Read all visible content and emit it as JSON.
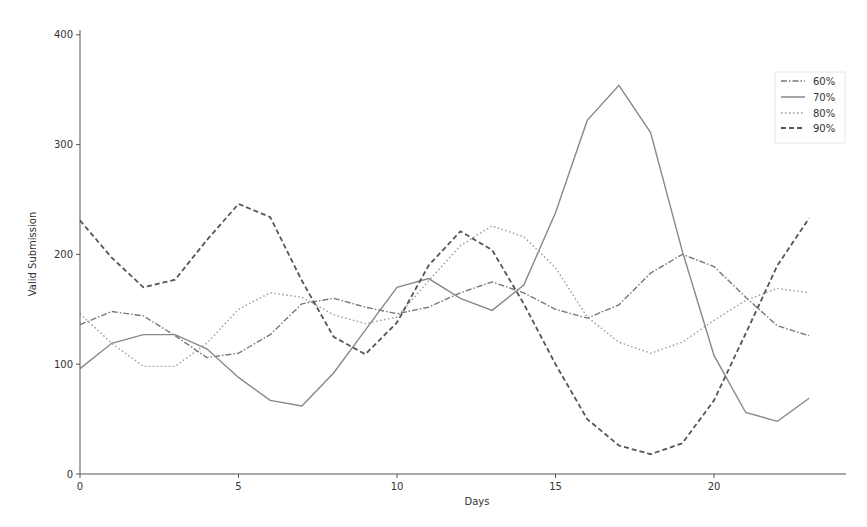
{
  "chart_data": {
    "type": "line",
    "title": "",
    "xlabel": "Days",
    "ylabel": "Valid Submission",
    "xlim": [
      0,
      23.2
    ],
    "ylim": [
      0,
      405
    ],
    "grid": false,
    "legend_position": "upper right",
    "x_ticks": [
      0,
      5,
      10,
      15,
      20
    ],
    "y_ticks": [
      0,
      100,
      200,
      300,
      400
    ],
    "x": [
      0,
      1,
      2,
      3,
      4,
      5,
      6,
      7,
      8,
      9,
      10,
      11,
      12,
      13,
      14,
      15,
      16,
      17,
      18,
      19,
      20,
      21,
      22,
      23
    ],
    "series": [
      {
        "name": "60%",
        "style": "dashdot",
        "color": "#777777",
        "values": [
          136,
          148,
          144,
          126,
          106,
          110,
          127,
          155,
          160,
          152,
          146,
          152,
          165,
          175,
          165,
          150,
          142,
          154,
          183,
          200,
          189,
          161,
          135,
          126
        ]
      },
      {
        "name": "70%",
        "style": "solid",
        "color": "#888888",
        "values": [
          96,
          119,
          127,
          127,
          114,
          88,
          67,
          62,
          92,
          131,
          170,
          178,
          160,
          149,
          172,
          238,
          322,
          354,
          311,
          203,
          108,
          56,
          48,
          69
        ]
      },
      {
        "name": "80%",
        "style": "dotted",
        "color": "#999999",
        "values": [
          146,
          119,
          98,
          98,
          119,
          150,
          165,
          161,
          145,
          137,
          143,
          176,
          208,
          226,
          216,
          188,
          143,
          120,
          110,
          120,
          140,
          158,
          169,
          165
        ]
      },
      {
        "name": "90%",
        "style": "dashed",
        "color": "#555555",
        "values": [
          231,
          197,
          170,
          177,
          213,
          246,
          234,
          176,
          125,
          109,
          138,
          190,
          221,
          204,
          155,
          100,
          50,
          26,
          18,
          28,
          67,
          128,
          190,
          233
        ]
      }
    ]
  },
  "axes": {
    "xlabel": "Days",
    "ylabel": "Valid Submission",
    "x_tick_labels": [
      "0",
      "5",
      "10",
      "15",
      "20"
    ],
    "y_tick_labels": [
      "0",
      "100",
      "200",
      "300",
      "400"
    ]
  },
  "legend": {
    "items": [
      {
        "label": "60%"
      },
      {
        "label": "70%"
      },
      {
        "label": "80%"
      },
      {
        "label": "90%"
      }
    ]
  }
}
